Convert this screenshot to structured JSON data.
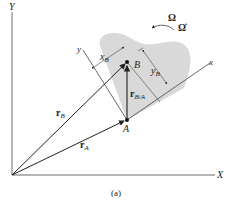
{
  "figure": {
    "caption": "(a)",
    "axes": {
      "X_label": "X",
      "Y_label": "Y",
      "x_label": "x",
      "y_label": "y"
    },
    "points": {
      "A": "A",
      "B": "B"
    },
    "vectors": {
      "rA": {
        "main": "r",
        "sub": "A"
      },
      "rB": {
        "main": "r",
        "sub": "B"
      },
      "rBA": {
        "main": "r",
        "sub": "B/A"
      }
    },
    "dimensions": {
      "xB": {
        "main": "x",
        "sub": "B"
      },
      "yB": {
        "main": "y",
        "sub": "B"
      }
    },
    "rotation": {
      "omega": "Ω",
      "omega_dot": "Ω̇"
    },
    "colors": {
      "body_fill": "#d9d9d9",
      "line": "#333333"
    }
  }
}
